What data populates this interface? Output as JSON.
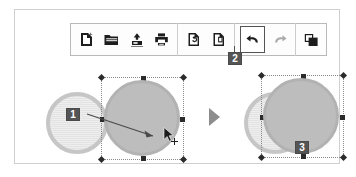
{
  "app": {
    "title": "Drawing editor — move shape and undo illustration",
    "background_color": "#ffffff",
    "frame_border_color": "#cfcfcf"
  },
  "toolbar": {
    "border_color": "#b9b9b9",
    "background_color": "#fdfdfd",
    "groups": [
      {
        "name": "file",
        "buttons": [
          {
            "id": "new",
            "icon": "new-document-icon",
            "label": "New",
            "state": "enabled"
          },
          {
            "id": "open",
            "icon": "open-folder-icon",
            "label": "Open",
            "state": "enabled"
          },
          {
            "id": "save",
            "icon": "save-disk-icon",
            "label": "Save",
            "state": "enabled"
          },
          {
            "id": "print",
            "icon": "printer-icon",
            "label": "Print",
            "state": "enabled"
          }
        ]
      },
      {
        "name": "page",
        "buttons": [
          {
            "id": "reload-page",
            "icon": "page-refresh-icon",
            "label": "Reload Page",
            "state": "enabled"
          },
          {
            "id": "new-page",
            "icon": "page-next-icon",
            "label": "New Page",
            "state": "enabled"
          }
        ]
      },
      {
        "name": "history",
        "buttons": [
          {
            "id": "undo",
            "icon": "undo-arrow-icon",
            "label": "Undo",
            "state": "selected"
          },
          {
            "id": "redo",
            "icon": "redo-arrow-icon",
            "label": "Redo",
            "state": "disabled"
          }
        ]
      },
      {
        "name": "arrange",
        "buttons": [
          {
            "id": "duplicate",
            "icon": "copy-shapes-icon",
            "label": "Duplicate",
            "state": "enabled"
          }
        ]
      }
    ]
  },
  "callouts": [
    {
      "id": "callout-1",
      "number": "1",
      "refers_to": "drag-arrow",
      "color": "#555555"
    },
    {
      "id": "callout-2",
      "number": "2",
      "refers_to": "undo-button",
      "color": "#555555"
    },
    {
      "id": "callout-3",
      "number": "3",
      "refers_to": "restored-state",
      "color": "#555555"
    }
  ],
  "canvas": {
    "before": {
      "name": "before-state",
      "shapes": [
        {
          "id": "circle-light-left",
          "type": "circle",
          "fill": "hatched-light-gray",
          "ring": "#c6c6c6",
          "selected": false
        },
        {
          "id": "circle-solid-moved",
          "type": "circle",
          "fill": "#bdbdbd",
          "ring": "#b2b2b2",
          "selected": true
        }
      ],
      "annotations": [
        {
          "id": "drag-arrow",
          "type": "arrow",
          "meaning": "shape dragged to the right"
        },
        {
          "id": "cursor",
          "type": "pointer-with-move-cross",
          "meaning": "mouse dragging the shape"
        }
      ]
    },
    "transition": {
      "id": "flow-arrow",
      "type": "play-triangle",
      "color": "#8d8d8d"
    },
    "after": {
      "name": "after-state",
      "shapes": [
        {
          "id": "circle-light-right",
          "type": "circle",
          "fill": "hatched-light-gray",
          "ring": "#c6c6c6",
          "selected": false
        },
        {
          "id": "circle-solid-back",
          "type": "circle",
          "fill": "#bdbdbd",
          "ring": "#b2b2b2",
          "selected": true
        }
      ]
    }
  }
}
